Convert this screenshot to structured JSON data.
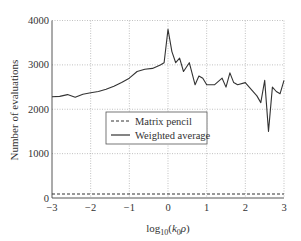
{
  "chart_data": {
    "type": "line",
    "title": "",
    "xlabel": "log10(k0 ρ)",
    "xlabel_parts": {
      "prefix": "log",
      "sub": "10",
      "open": "(",
      "k": "k",
      "ksub": "0",
      "rho": "ρ",
      "close": ")"
    },
    "ylabel": "Number of evaluations",
    "xlim": [
      -3,
      3
    ],
    "ylim": [
      0,
      4000
    ],
    "x_ticks": [
      -3,
      -2,
      -1,
      0,
      1,
      2,
      3
    ],
    "x_tick_labels": [
      "−3",
      "−2",
      "−1",
      "0",
      "1",
      "2",
      "3"
    ],
    "y_ticks": [
      0,
      1000,
      2000,
      3000,
      4000
    ],
    "y_tick_labels": [
      "0",
      "1000",
      "2000",
      "3000",
      "4000"
    ],
    "grid": true,
    "legend_position": "center-left",
    "series": [
      {
        "name": "Matrix pencil",
        "style": "dashed",
        "color": "#333333",
        "x": [
          -3,
          3
        ],
        "y": [
          90,
          90
        ]
      },
      {
        "name": "Weighted average",
        "style": "solid",
        "color": "#333333",
        "x": [
          -3,
          -2.8,
          -2.6,
          -2.4,
          -2.2,
          -2.0,
          -1.8,
          -1.6,
          -1.4,
          -1.2,
          -1.0,
          -0.8,
          -0.6,
          -0.4,
          -0.2,
          -0.1,
          0.0,
          0.1,
          0.2,
          0.3,
          0.4,
          0.55,
          0.7,
          0.8,
          0.9,
          1.0,
          1.2,
          1.4,
          1.5,
          1.6,
          1.7,
          1.8,
          2.0,
          2.1,
          2.3,
          2.4,
          2.5,
          2.6,
          2.7,
          2.8,
          2.9,
          3.0
        ],
        "y": [
          2280,
          2290,
          2330,
          2270,
          2340,
          2370,
          2400,
          2450,
          2520,
          2600,
          2700,
          2850,
          2900,
          2920,
          3000,
          3050,
          3800,
          3300,
          3050,
          3150,
          2850,
          3050,
          2550,
          2750,
          2700,
          2550,
          2550,
          2700,
          2500,
          2820,
          2600,
          2550,
          2600,
          2500,
          2300,
          2150,
          2650,
          1500,
          2500,
          2400,
          2350,
          2650
        ]
      }
    ]
  },
  "legend": {
    "items": [
      {
        "label": "Matrix pencil",
        "style": "dashed"
      },
      {
        "label": "Weighted average",
        "style": "solid"
      }
    ]
  }
}
